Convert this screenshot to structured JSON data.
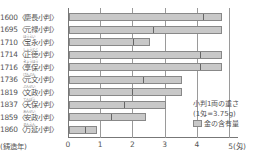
{
  "chart_data": {
    "type": "bar",
    "orientation": "horizontal",
    "title": "",
    "xlabel": "",
    "ylabel": "(鋳造年)",
    "x_unit": "匁",
    "xlim": [
      0,
      5
    ],
    "x_ticks": [
      "0",
      "1",
      "2",
      "3",
      "4",
      "5(匁)"
    ],
    "grid": true,
    "categories": [
      "1600(慶長小判)",
      "1695(元禄小判)",
      "1710(宝永小判)",
      "1714(正徳小判)",
      "1716(享保小判)",
      "1736(元文小判)",
      "1819(文政小判)",
      "1837(天保小判)",
      "1859(安政小判)",
      "1860(万延小判)"
    ],
    "series": [
      {
        "name": "小判1両の重さ",
        "values": [
          4.76,
          4.76,
          2.5,
          4.76,
          4.76,
          3.5,
          3.5,
          3.0,
          2.4,
          0.88
        ]
      },
      {
        "name": "金の含有量",
        "values": [
          4.15,
          2.6,
          2.0,
          4.06,
          4.06,
          2.3,
          1.95,
          1.7,
          1.3,
          0.5
        ]
      }
    ],
    "legend": {
      "title": "小判1両の重さ",
      "note": "(1匁=3.75g)",
      "entry": "金の含有量",
      "position": "bottom-right"
    }
  },
  "labels": {
    "rows": [
      {
        "text": "1600〈慶長小判〉",
        "ruby": ""
      },
      {
        "text": "1695〈元禄小判〉",
        "ruby": ""
      },
      {
        "text": "1710〈宝永小判〉",
        "ruby": "ほうえい"
      },
      {
        "text": "1714〈正徳小判〉",
        "ruby": "しょうとく"
      },
      {
        "text": "1716〈享保小判〉",
        "ruby": "きょうほう"
      },
      {
        "text": "1736〈元文小判〉",
        "ruby": "げんぶん"
      },
      {
        "text": "1819〈文政小判〉",
        "ruby": "ぶんせい"
      },
      {
        "text": "1837〈天保小判〉",
        "ruby": "てんぽう"
      },
      {
        "text": "1859〈安政小判〉",
        "ruby": "あんせい"
      },
      {
        "text": "1860〈万延小判〉",
        "ruby": "まんえん"
      }
    ],
    "year_caption": "(鋳造年)",
    "ticks": [
      "0",
      "1",
      "2",
      "3",
      "4",
      "5(匁)"
    ],
    "legend_title": "小判1両の重さ",
    "legend_note": "(1匁=3.75g)",
    "legend_ruby": "もんめ",
    "legend_entry": "金の含有量"
  },
  "colors": {
    "bar_fill": "#c8c8c8",
    "bar_border": "#888888",
    "divider": "#666666",
    "grid": "#9a9a9a"
  }
}
